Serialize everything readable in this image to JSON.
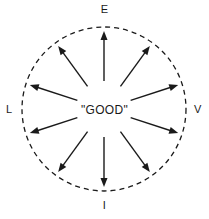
{
  "figure": {
    "type": "radial-diagram",
    "background_color": "#ffffff",
    "stroke_color": "#1a1a1a",
    "text_color": "#1a1a1a",
    "center_label": "\"GOOD\"",
    "boundary": {
      "shape": "circle",
      "style": "dashed",
      "cx": 104,
      "cy": 109,
      "r": 82,
      "dash": "5 4",
      "stroke_width": 1.3
    },
    "axis_labels": {
      "top": "E",
      "right": "V",
      "bottom": "I",
      "left": "L"
    },
    "arrows": {
      "count": 10,
      "direction": "outward-from-center",
      "angles_deg": [
        90,
        54,
        18,
        -18,
        -54,
        -90,
        -126,
        -162,
        162,
        126
      ],
      "inner_radius": 28,
      "outer_radius": 78,
      "stroke_width": 1.4,
      "head_length": 9,
      "head_width": 7
    }
  }
}
